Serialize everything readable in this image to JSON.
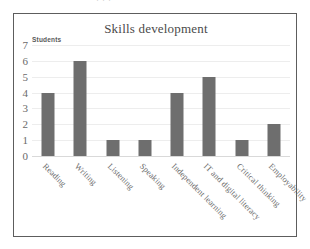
{
  "page": {
    "top_cropped_text": "· · ·"
  },
  "chart_data": {
    "type": "bar",
    "title": "Skills development",
    "xlabel": "",
    "ylabel": "Students",
    "categories": [
      "Reading",
      "Writing",
      "Listening",
      "Speaking",
      "Independent learning",
      "IT and digital literacy",
      "Critical thinking",
      "Employability"
    ],
    "values": [
      4,
      6,
      1,
      1,
      4,
      5,
      1,
      2
    ],
    "yticks": [
      0,
      1,
      2,
      3,
      4,
      5,
      6,
      7
    ],
    "ylim": [
      0,
      7
    ],
    "grid": true,
    "legend": false,
    "bar_color": "#6e6e6e",
    "gridline_color": "#ededed",
    "label_rotation": 45
  }
}
